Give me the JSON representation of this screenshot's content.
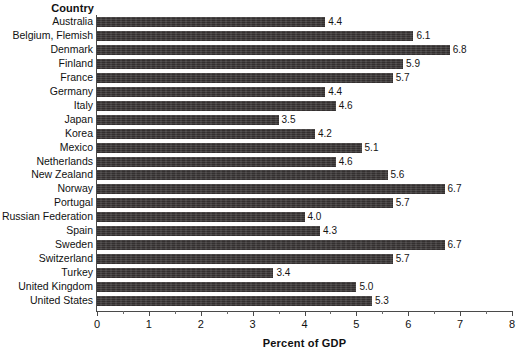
{
  "chart_data": {
    "type": "bar",
    "orientation": "horizontal",
    "title": "",
    "xlabel": "Percent of GDP",
    "ylabel": "Country",
    "xlim": [
      0,
      8
    ],
    "xticks": [
      0,
      1,
      2,
      3,
      4,
      5,
      6,
      7,
      8
    ],
    "xtick_labels": [
      "0",
      "1",
      "2",
      "3",
      "4",
      "5",
      "6",
      "7",
      "8"
    ],
    "minor_tick_step": 0.5,
    "grid": false,
    "legend": null,
    "bar_color": "#332f2f",
    "value_label_format": "0.0",
    "categories": [
      "Australia",
      "Belgium, Flemish",
      "Denmark",
      "Finland",
      "France",
      "Germany",
      "Italy",
      "Japan",
      "Korea",
      "Mexico",
      "Netherlands",
      "New Zealand",
      "Norway",
      "Portugal",
      "Russian Federation",
      "Spain",
      "Sweden",
      "Switzerland",
      "Turkey",
      "United Kingdom",
      "United States"
    ],
    "values": [
      4.4,
      6.1,
      6.8,
      5.9,
      5.7,
      4.4,
      4.6,
      3.5,
      4.2,
      5.1,
      4.6,
      5.6,
      6.7,
      5.7,
      4.0,
      4.3,
      6.7,
      5.7,
      3.4,
      5.0,
      5.3
    ],
    "value_labels": [
      "4.4",
      "6.1",
      "6.8",
      "5.9",
      "5.7",
      "4.4",
      "4.6",
      "3.5",
      "4.2",
      "5.1",
      "4.6",
      "5.6",
      "6.7",
      "5.7",
      "4.0",
      "4.3",
      "6.7",
      "5.7",
      "3.4",
      "5.0",
      "5.3"
    ]
  },
  "axes": {
    "category_header": "Country",
    "value_axis_title": "Percent of GDP"
  }
}
